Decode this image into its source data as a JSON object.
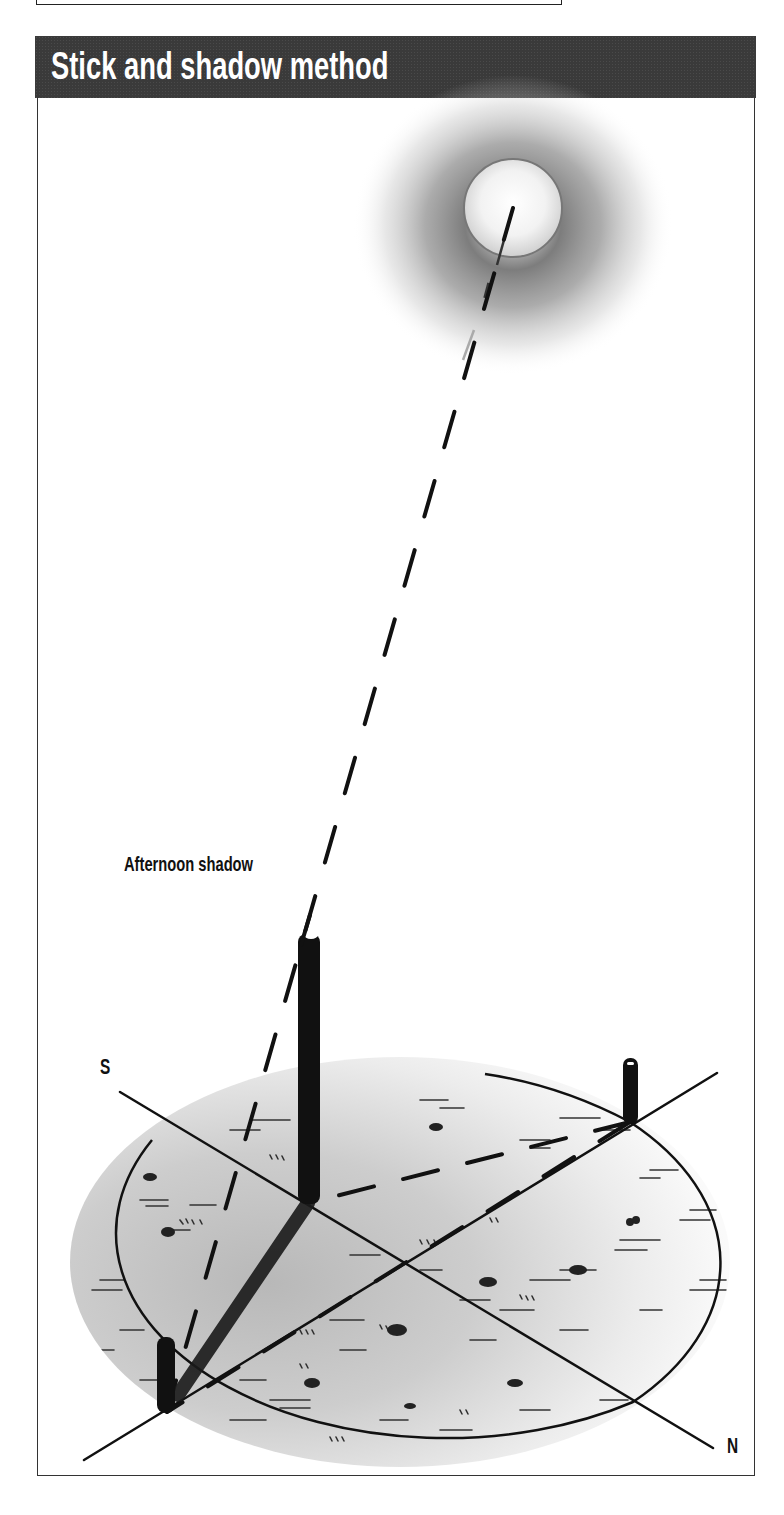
{
  "figure": {
    "title": "Stick and shadow method",
    "labels": {
      "afternoon_shadow": "Afternoon shadow",
      "south": "S",
      "north": "N"
    },
    "elements": {
      "sun": "sun-with-glow",
      "center_stick": "vertical stick",
      "shadow_tip_stick": "stick marking afternoon shadow tip",
      "morning_stick": "stick marking earlier shadow tip",
      "ground": "shaded elliptical ground area with grass marks",
      "compass_line": "south-north line"
    },
    "colors": {
      "header_bg": "#3a3a3a",
      "header_text": "#ffffff",
      "ink": "#111111",
      "ground_shade": "#c8c8c8"
    }
  }
}
